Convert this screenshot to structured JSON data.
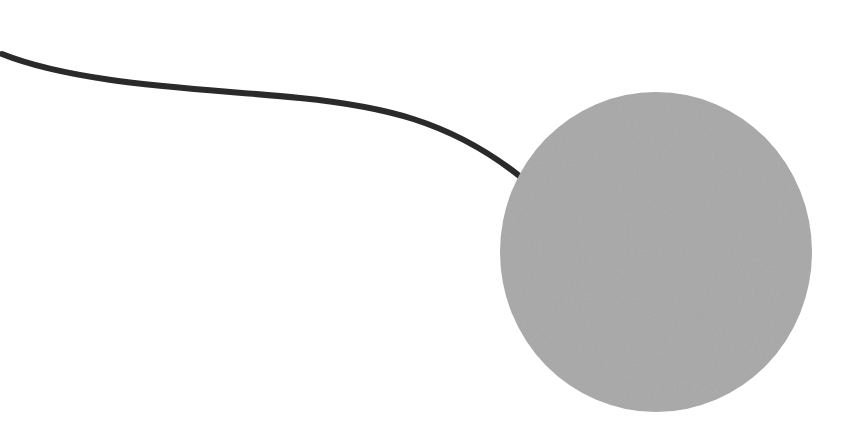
{
  "scene": {
    "width": 860,
    "height": 435,
    "background": "#ffffff",
    "circle": {
      "cx": 656,
      "cy": 252,
      "rx": 156,
      "ry": 160,
      "fill": "#a8a8a8"
    },
    "string": {
      "path": "M 2 54 C 80 85, 200 88, 300 98 C 380 106, 450 120, 522 178",
      "stroke": "#2a2a2a",
      "width": 6
    }
  }
}
